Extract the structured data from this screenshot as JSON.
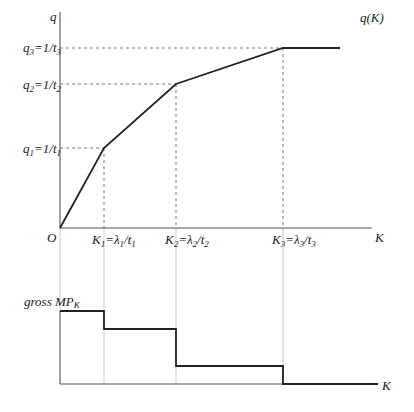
{
  "top_chart": {
    "y_axis_label": "q",
    "x_axis_label": "K",
    "origin_label": "O",
    "curve_label": "q(K)",
    "y_ticks": [
      {
        "main": "q",
        "sub": "3",
        "rest": "=1/t",
        "rest_sub": "3"
      },
      {
        "main": "q",
        "sub": "2",
        "rest": "=1/t",
        "rest_sub": "2"
      },
      {
        "main": "q",
        "sub": "1",
        "rest": "=1/t",
        "rest_sub": "1"
      }
    ],
    "x_ticks": [
      {
        "main": "K",
        "sub": "1",
        "rest": "=λ",
        "rest_sub": "1",
        "tail": "/t",
        "tail_sub": "1"
      },
      {
        "main": "K",
        "sub": "2",
        "rest": "=λ",
        "rest_sub": "2",
        "tail": "/t",
        "tail_sub": "2"
      },
      {
        "main": "K",
        "sub": "3",
        "rest": "=λ",
        "rest_sub": "3",
        "tail": "/t",
        "tail_sub": "3"
      }
    ]
  },
  "bottom_chart": {
    "y_axis_label": "gross MP",
    "y_axis_label_sub": "K",
    "x_axis_label": "K"
  },
  "colors": {
    "curve": "#222222",
    "axis": "#555555",
    "dash": "#666666"
  }
}
